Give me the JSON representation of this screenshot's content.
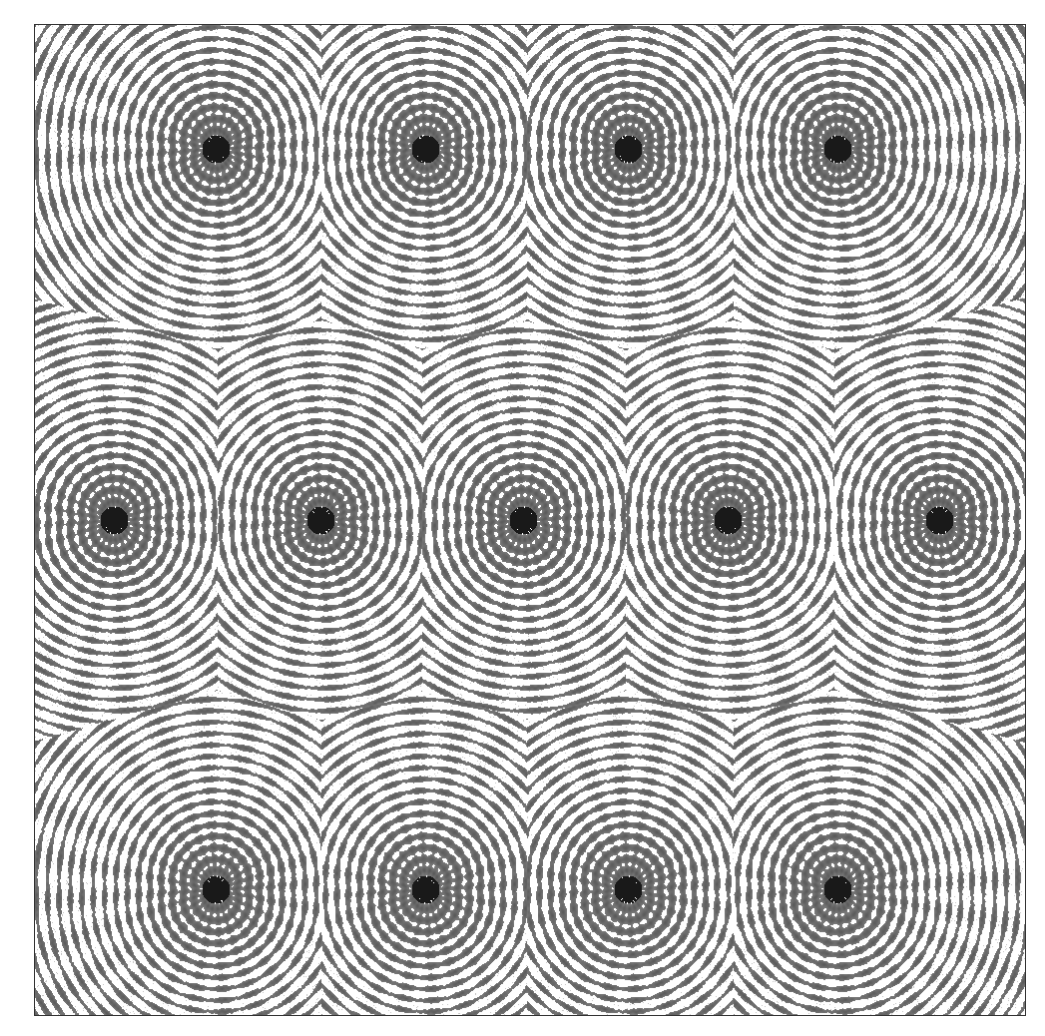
{
  "image": {
    "width": 1045,
    "height": 1036,
    "background": "#ffffff"
  },
  "frame": {
    "left": 34,
    "top": 24,
    "right": 1026,
    "bottom": 1016,
    "border_color": "#333333"
  },
  "palette": {
    "ink": "#1a1a1a",
    "mid": "#6b6b6b",
    "paper": "#ffffff"
  },
  "star_centers": {
    "top_row": {
      "y": 148,
      "x": [
        215,
        425,
        628,
        838
      ]
    },
    "middle_row": {
      "y": 520,
      "x": [
        113,
        320,
        523,
        728,
        940
      ]
    },
    "bottom_row": {
      "y": 890,
      "x": [
        215,
        425,
        628,
        838
      ]
    }
  }
}
